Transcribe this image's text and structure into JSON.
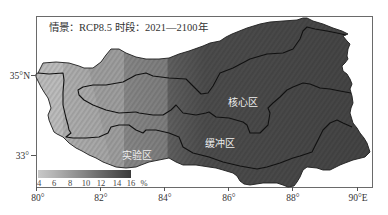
{
  "title": {
    "scenario": "情景：RCP8.5",
    "period": "时段：2021—2100年"
  },
  "map": {
    "zones": {
      "core": "核心区",
      "buffer": "缓冲区",
      "experimental": "实验区"
    },
    "band_colors": [
      "#bcbcbc",
      "#aeaeae",
      "#a3a3a3",
      "#878787",
      "#7d7d7d",
      "#606060",
      "#4c4c4c",
      "#444444"
    ],
    "wedge_color": "#9e9e9e",
    "label_color": "#eeeeee"
  },
  "axes": {
    "x_ticks": [
      "80°",
      "82°",
      "84°",
      "86°",
      "88°",
      "90°E"
    ],
    "y_ticks": [
      "35°N",
      "33°"
    ]
  },
  "legend": {
    "ticks": [
      "4",
      "6",
      "8",
      "10",
      "12",
      "14",
      "16"
    ],
    "unit": "%",
    "colors": [
      "#c8c8c8",
      "#b4b4b4",
      "#9c9c9c",
      "#848484",
      "#6a6a6a",
      "#525252",
      "#3a3a3a"
    ]
  }
}
